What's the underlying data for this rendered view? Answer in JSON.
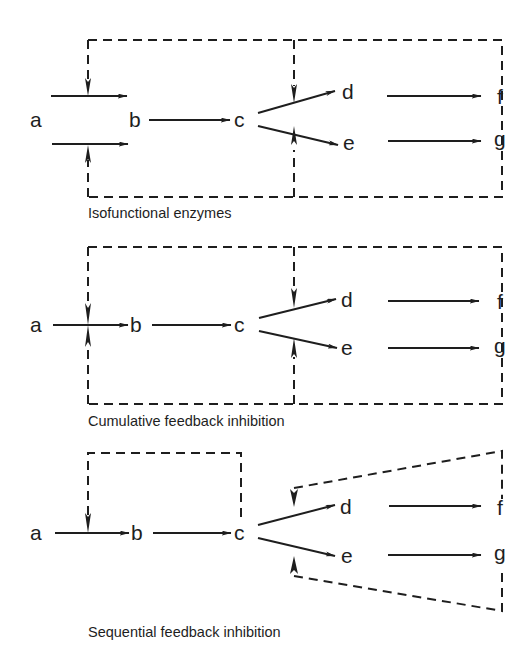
{
  "diagram": {
    "panels": [
      {
        "caption": "Isofunctional enzymes",
        "nodes": {
          "a": "a",
          "b": "b",
          "c": "c",
          "d": "d",
          "e": "e",
          "f": "f",
          "g": "g"
        }
      },
      {
        "caption": "Cumulative feedback inhibition",
        "nodes": {
          "a": "a",
          "b": "b",
          "c": "c",
          "d": "d",
          "e": "e",
          "f": "f",
          "g": "g"
        }
      },
      {
        "caption": "Sequential feedback inhibition",
        "nodes": {
          "a": "a",
          "b": "b",
          "c": "c",
          "d": "d",
          "e": "e",
          "f": "f",
          "g": "g"
        }
      }
    ],
    "colors": {
      "ink": "#1e1e1e",
      "background": "#ffffff"
    }
  }
}
